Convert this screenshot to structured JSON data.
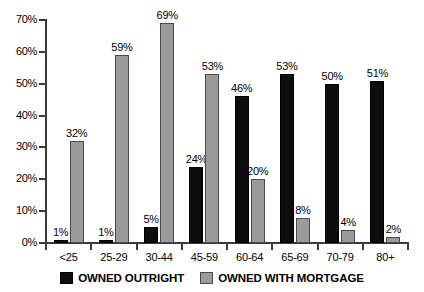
{
  "chart_data": {
    "type": "bar",
    "title": "",
    "subtitle": "",
    "xlabel": "",
    "ylabel": "",
    "ylim": [
      0,
      70
    ],
    "ytick_labels": [
      "0%",
      "10%",
      "20%",
      "30%",
      "40%",
      "50%",
      "60%",
      "70%"
    ],
    "ytick_values": [
      0,
      10,
      20,
      30,
      40,
      50,
      60,
      70
    ],
    "grid": false,
    "legend_position": "bottom",
    "value_label_suffix": "%",
    "categories": [
      "<25",
      "25-29",
      "30-44",
      "45-59",
      "60-64",
      "65-69",
      "70-79",
      "80+"
    ],
    "series": [
      {
        "name": "OWNED OUTRIGHT",
        "color": "#0d0d0d",
        "values": [
          1,
          1,
          5,
          24,
          46,
          53,
          50,
          51
        ],
        "labels": [
          "1%",
          "1%",
          "5%",
          "24%",
          "46%",
          "53%",
          "50%",
          "51%"
        ]
      },
      {
        "name": "OWNED WITH MORTGAGE",
        "color": "#9a9a9a",
        "values": [
          32,
          59,
          69,
          53,
          20,
          8,
          4,
          2
        ],
        "labels": [
          "32%",
          "59%",
          "69%",
          "53%",
          "20%",
          "8%",
          "4%",
          "2%"
        ]
      }
    ]
  },
  "legend": {
    "items": [
      {
        "label": "OWNED OUTRIGHT",
        "color": "#0d0d0d"
      },
      {
        "label": "OWNED WITH MORTGAGE",
        "color": "#9a9a9a"
      }
    ]
  }
}
